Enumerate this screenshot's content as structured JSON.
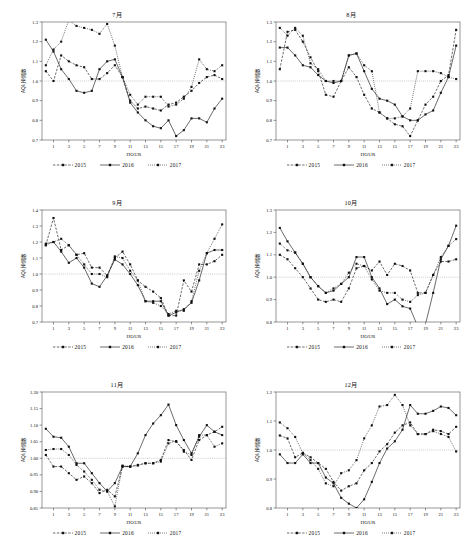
{
  "figure": {
    "width": 468,
    "height": 556,
    "background": "#ffffff",
    "ink": "#111111",
    "reference_line_color": "#9aa0a6"
  },
  "common": {
    "xlabel": "HOUR",
    "ylabel": "AQI小时指数",
    "xticks": [
      1,
      3,
      5,
      7,
      9,
      11,
      13,
      15,
      17,
      19,
      21,
      23
    ],
    "hours": [
      0,
      1,
      2,
      3,
      4,
      5,
      6,
      7,
      8,
      9,
      10,
      11,
      12,
      13,
      14,
      15,
      16,
      17,
      18,
      19,
      20,
      21,
      22,
      23
    ],
    "reference_value": 1.0,
    "legend": [
      {
        "name": "2015",
        "style": "dashed",
        "marker": "square"
      },
      {
        "name": "2016",
        "style": "solid",
        "marker": "square"
      },
      {
        "name": "2017",
        "style": "dotted",
        "marker": "square"
      }
    ]
  },
  "chart_data": [
    {
      "id": "jul",
      "type": "line",
      "title": "7月",
      "xlabel": "HOUR",
      "ylabel": "AQI小时指数",
      "xlim": [
        -0.5,
        23.5
      ],
      "ylim": [
        0.7,
        1.3
      ],
      "yticks": [
        0.7,
        0.8,
        0.9,
        1.0,
        1.1,
        1.2,
        1.3
      ],
      "ytick_labels": [
        "0.7",
        "0.8",
        "0.9",
        "1.0",
        "1.1",
        "1.2",
        "1.3"
      ],
      "grid": false,
      "legend_position": "below",
      "x": [
        0,
        1,
        2,
        3,
        4,
        5,
        6,
        7,
        8,
        9,
        10,
        11,
        12,
        13,
        14,
        15,
        16,
        17,
        18,
        19,
        20,
        21,
        22,
        23
      ],
      "series": [
        {
          "name": "2015",
          "values": [
            1.05,
            1.0,
            1.13,
            1.1,
            1.08,
            1.07,
            1.01,
            1.01,
            1.04,
            1.08,
            1.02,
            0.9,
            0.86,
            0.87,
            0.86,
            0.85,
            0.88,
            0.89,
            0.92,
            0.95,
            0.99,
            1.02,
            1.03,
            1.01
          ]
        },
        {
          "name": "2016",
          "values": [
            1.21,
            1.15,
            1.06,
            1.01,
            0.95,
            0.94,
            0.95,
            1.06,
            1.1,
            1.11,
            1.02,
            0.89,
            0.84,
            0.8,
            0.77,
            0.76,
            0.8,
            0.72,
            0.75,
            0.81,
            0.81,
            0.79,
            0.86,
            0.91
          ]
        },
        {
          "name": "2017",
          "values": [
            1.08,
            1.16,
            1.2,
            1.31,
            1.28,
            1.27,
            1.26,
            1.24,
            1.29,
            1.18,
            1.02,
            0.93,
            0.88,
            0.92,
            0.92,
            0.92,
            0.87,
            0.88,
            0.91,
            0.97,
            1.11,
            1.06,
            1.05,
            1.08
          ]
        }
      ]
    },
    {
      "id": "aug",
      "type": "line",
      "title": "8月",
      "xlabel": "HOUR",
      "ylabel": "AQI小时指数",
      "xlim": [
        -0.5,
        23.5
      ],
      "ylim": [
        0.7,
        1.3
      ],
      "yticks": [
        0.7,
        0.8,
        0.9,
        1.0,
        1.1,
        1.2,
        1.3
      ],
      "ytick_labels": [
        "0.7",
        "0.8",
        "0.9",
        "1.0",
        "1.1",
        "1.2",
        "1.3"
      ],
      "grid": false,
      "legend_position": "below",
      "x": [
        0,
        1,
        2,
        3,
        4,
        5,
        6,
        7,
        8,
        9,
        10,
        11,
        12,
        13,
        14,
        15,
        16,
        17,
        18,
        19,
        20,
        21,
        22,
        23
      ],
      "series": [
        {
          "name": "2015",
          "values": [
            1.06,
            1.25,
            1.26,
            1.2,
            1.12,
            1.05,
            0.93,
            0.92,
            1.0,
            1.07,
            1.02,
            0.93,
            0.86,
            0.84,
            0.81,
            0.78,
            0.77,
            0.72,
            0.8,
            0.88,
            0.92,
            1.0,
            1.03,
            1.26
          ]
        },
        {
          "name": "2016",
          "values": [
            1.17,
            1.17,
            1.13,
            1.08,
            1.07,
            1.03,
            1.0,
            0.99,
            1.0,
            1.13,
            1.14,
            1.05,
            0.96,
            0.91,
            0.9,
            0.88,
            0.82,
            0.8,
            0.8,
            0.83,
            0.85,
            0.94,
            1.02,
            1.18
          ]
        },
        {
          "name": "2017",
          "values": [
            1.27,
            1.23,
            1.27,
            1.23,
            1.09,
            1.06,
            1.0,
            1.0,
            1.0,
            1.13,
            1.14,
            1.08,
            1.05,
            0.84,
            0.81,
            0.81,
            0.82,
            0.86,
            1.05,
            1.05,
            1.05,
            1.04,
            1.02,
            1.01
          ]
        }
      ]
    },
    {
      "id": "sep",
      "type": "line",
      "title": "9月",
      "xlabel": "HOUR",
      "ylabel": "AQI小时指数",
      "xlim": [
        -0.5,
        23.5
      ],
      "ylim": [
        0.7,
        1.4
      ],
      "yticks": [
        0.7,
        0.8,
        0.9,
        1.0,
        1.1,
        1.2,
        1.3,
        1.4
      ],
      "ytick_labels": [
        "0.7",
        "0.8",
        "0.9",
        "1.0",
        "1.1",
        "1.2",
        "1.3",
        "1.4"
      ],
      "grid": false,
      "legend_position": "below",
      "x": [
        0,
        1,
        2,
        3,
        4,
        5,
        6,
        7,
        8,
        9,
        10,
        11,
        12,
        13,
        14,
        15,
        16,
        17,
        18,
        19,
        20,
        21,
        22,
        23
      ],
      "series": [
        {
          "name": "2015",
          "values": [
            1.18,
            1.35,
            1.15,
            1.18,
            1.12,
            1.13,
            1.04,
            1.04,
            0.99,
            1.1,
            1.14,
            1.06,
            0.96,
            0.92,
            0.89,
            0.85,
            0.74,
            0.74,
            0.96,
            0.89,
            1.06,
            1.06,
            1.08,
            1.12
          ]
        },
        {
          "name": "2016",
          "values": [
            1.19,
            1.2,
            1.14,
            1.07,
            1.1,
            1.04,
            0.94,
            0.92,
            0.99,
            1.09,
            1.06,
            1.0,
            0.93,
            0.83,
            0.83,
            0.83,
            0.74,
            0.76,
            0.78,
            0.82,
            0.96,
            1.13,
            1.15,
            1.15
          ]
        },
        {
          "name": "2017",
          "values": [
            1.18,
            1.2,
            1.22,
            1.18,
            1.12,
            1.06,
            1.0,
            1.0,
            0.98,
            1.11,
            1.1,
            1.02,
            0.96,
            0.83,
            0.82,
            0.8,
            0.75,
            0.77,
            0.77,
            0.83,
            1.02,
            1.13,
            1.22,
            1.31
          ]
        }
      ]
    },
    {
      "id": "oct",
      "type": "line",
      "title": "10月",
      "xlabel": "HOUR",
      "ylabel": "AQI小时指数",
      "xlim": [
        -0.5,
        23.5
      ],
      "ylim": [
        0.8,
        1.3
      ],
      "yticks": [
        0.8,
        0.9,
        1.0,
        1.1,
        1.2,
        1.3
      ],
      "ytick_labels": [
        "0.8",
        "0.9",
        "1.0",
        "1.1",
        "1.2",
        "1.3"
      ],
      "grid": false,
      "legend_position": "below",
      "x": [
        0,
        1,
        2,
        3,
        4,
        5,
        6,
        7,
        8,
        9,
        10,
        11,
        12,
        13,
        14,
        15,
        16,
        17,
        18,
        19,
        20,
        21,
        22,
        23
      ],
      "series": [
        {
          "name": "2015",
          "values": [
            1.1,
            1.08,
            1.04,
            1.0,
            0.95,
            0.9,
            0.89,
            0.9,
            0.89,
            0.95,
            1.04,
            1.05,
            1.03,
            1.07,
            1.01,
            1.06,
            1.05,
            1.03,
            0.93,
            0.93,
            1.01,
            1.07,
            1.07,
            1.08
          ]
        },
        {
          "name": "2016",
          "values": [
            1.22,
            1.16,
            1.11,
            1.06,
            1.0,
            0.96,
            0.93,
            0.94,
            0.97,
            1.0,
            1.09,
            1.09,
            1.0,
            0.95,
            0.88,
            0.9,
            0.87,
            0.86,
            0.78,
            0.79,
            0.93,
            1.08,
            1.14,
            1.23
          ]
        },
        {
          "name": "2017",
          "values": [
            1.15,
            1.12,
            1.11,
            1.06,
            1.0,
            0.96,
            0.93,
            0.95,
            0.97,
            1.02,
            1.06,
            1.05,
            0.99,
            0.94,
            0.93,
            0.93,
            0.9,
            0.89,
            0.92,
            0.93,
            1.01,
            1.09,
            1.14,
            1.17
          ]
        }
      ]
    },
    {
      "id": "nov",
      "type": "line",
      "title": "11月",
      "xlabel": "HOUR",
      "ylabel": "AQI小时指数",
      "xlim": [
        -0.5,
        23.5
      ],
      "ylim": [
        0.85,
        1.2
      ],
      "yticks": [
        0.85,
        0.9,
        0.95,
        1.0,
        1.05,
        1.1,
        1.15,
        1.2
      ],
      "ytick_labels": [
        "0.85",
        "0.90",
        "0.95",
        "1.00",
        "1.05",
        "1.10",
        "1.15",
        "1.20"
      ],
      "grid": false,
      "legend_position": "below",
      "x": [
        0,
        1,
        2,
        3,
        4,
        5,
        6,
        7,
        8,
        9,
        10,
        11,
        12,
        13,
        14,
        15,
        16,
        17,
        18,
        19,
        20,
        21,
        22,
        23
      ],
      "series": [
        {
          "name": "2015",
          "values": [
            1.01,
            0.975,
            0.975,
            0.955,
            0.935,
            0.945,
            0.925,
            0.895,
            0.905,
            0.885,
            0.975,
            0.975,
            0.98,
            0.985,
            0.985,
            0.995,
            1.055,
            1.05,
            1.025,
            0.995,
            1.055,
            1.07,
            1.08,
            1.095
          ]
        },
        {
          "name": "2016",
          "values": [
            1.089,
            1.065,
            1.062,
            1.035,
            0.985,
            0.985,
            0.955,
            0.925,
            0.9,
            0.925,
            0.975,
            0.975,
            1.015,
            1.07,
            1.105,
            1.13,
            1.162,
            1.1,
            1.055,
            1.015,
            1.065,
            1.1,
            1.08,
            1.07
          ]
        },
        {
          "name": "2017",
          "values": [
            1.025,
            1.028,
            1.028,
            1.01,
            0.98,
            0.96,
            0.935,
            0.905,
            0.9,
            0.855,
            0.978,
            0.975,
            0.978,
            0.985,
            0.985,
            0.99,
            1.045,
            1.052,
            1.02,
            1.01,
            1.07,
            1.07,
            1.035,
            1.045
          ]
        }
      ]
    },
    {
      "id": "dec",
      "type": "line",
      "title": "12月",
      "xlabel": "HOUR",
      "ylabel": "AQI小时指数",
      "xlim": [
        -0.5,
        23.5
      ],
      "ylim": [
        0.8,
        1.2
      ],
      "yticks": [
        0.8,
        0.9,
        1.0,
        1.1,
        1.2
      ],
      "ytick_labels": [
        "0.8",
        "0.9",
        "1.0",
        "1.1",
        "1.2"
      ],
      "grid": false,
      "legend_position": "below",
      "x": [
        0,
        1,
        2,
        3,
        4,
        5,
        6,
        7,
        8,
        9,
        10,
        11,
        12,
        13,
        14,
        15,
        16,
        17,
        18,
        19,
        20,
        21,
        22,
        23
      ],
      "series": [
        {
          "name": "2015",
          "values": [
            1.05,
            1.04,
            0.975,
            0.99,
            0.975,
            0.955,
            0.935,
            0.89,
            0.86,
            0.875,
            0.885,
            0.93,
            0.955,
            0.995,
            1.02,
            1.06,
            1.085,
            1.095,
            1.055,
            1.055,
            1.07,
            1.065,
            1.055,
            1.08
          ]
        },
        {
          "name": "2016",
          "values": [
            0.985,
            0.955,
            0.955,
            0.985,
            0.955,
            0.955,
            0.905,
            0.885,
            0.835,
            0.815,
            0.8,
            0.83,
            0.89,
            0.955,
            1.005,
            1.03,
            1.07,
            1.155,
            1.125,
            1.125,
            1.135,
            1.15,
            1.145,
            1.12
          ]
        },
        {
          "name": "2017",
          "values": [
            1.095,
            1.075,
            1.045,
            0.99,
            0.965,
            0.935,
            0.885,
            0.875,
            0.92,
            0.93,
            0.965,
            1.04,
            1.085,
            1.15,
            1.155,
            1.19,
            1.155,
            1.085,
            1.055,
            1.055,
            1.065,
            1.055,
            1.045,
            0.995
          ]
        }
      ]
    }
  ]
}
